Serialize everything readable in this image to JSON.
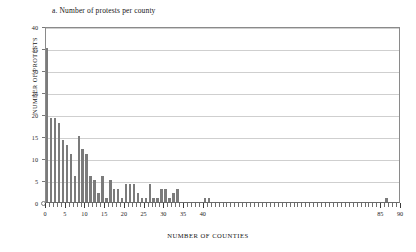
{
  "chart_data": {
    "type": "bar",
    "title": "a.  Number of protests per county",
    "xlabel": "NUMBER OF COUNTIES",
    "ylabel": "NUMBER OF PROTESTS",
    "xlim": [
      0,
      90
    ],
    "ylim": [
      0,
      40
    ],
    "grid": true,
    "legend": "none",
    "y_ticks": [
      0,
      5,
      10,
      15,
      20,
      25,
      30,
      35,
      40
    ],
    "x_ticks": [
      0,
      5,
      10,
      15,
      20,
      25,
      30,
      35,
      40,
      85,
      90
    ],
    "x_minor_tick_step": 1,
    "bar_color": "#7b7b7b",
    "x": [
      0,
      1,
      2,
      3,
      4,
      5,
      6,
      7,
      8,
      9,
      10,
      11,
      12,
      13,
      14,
      15,
      16,
      17,
      18,
      19,
      20,
      21,
      22,
      23,
      24,
      25,
      26,
      27,
      28,
      29,
      30,
      31,
      32,
      33,
      34,
      35,
      36,
      37,
      38,
      39,
      40,
      41,
      42,
      43,
      44,
      45,
      86
    ],
    "values": [
      35,
      19,
      19,
      18,
      14,
      13,
      11,
      6,
      15,
      12,
      11,
      6,
      5,
      2,
      6,
      1,
      5,
      3,
      3,
      1,
      4,
      4,
      4,
      2,
      1,
      1,
      4,
      1,
      1,
      3,
      3,
      1,
      2,
      3,
      0,
      0,
      0,
      0,
      0,
      0,
      1,
      1,
      0,
      0,
      0,
      0,
      1
    ],
    "units": "counties on x, protest count frequency on y"
  },
  "axis": {
    "y_labels": [
      "0",
      "5",
      "10",
      "15",
      "20",
      "25",
      "30",
      "35",
      "40"
    ],
    "x_labels": [
      "0",
      "5",
      "10",
      "15",
      "20",
      "25",
      "30",
      "35",
      "40",
      "85",
      "90"
    ]
  }
}
